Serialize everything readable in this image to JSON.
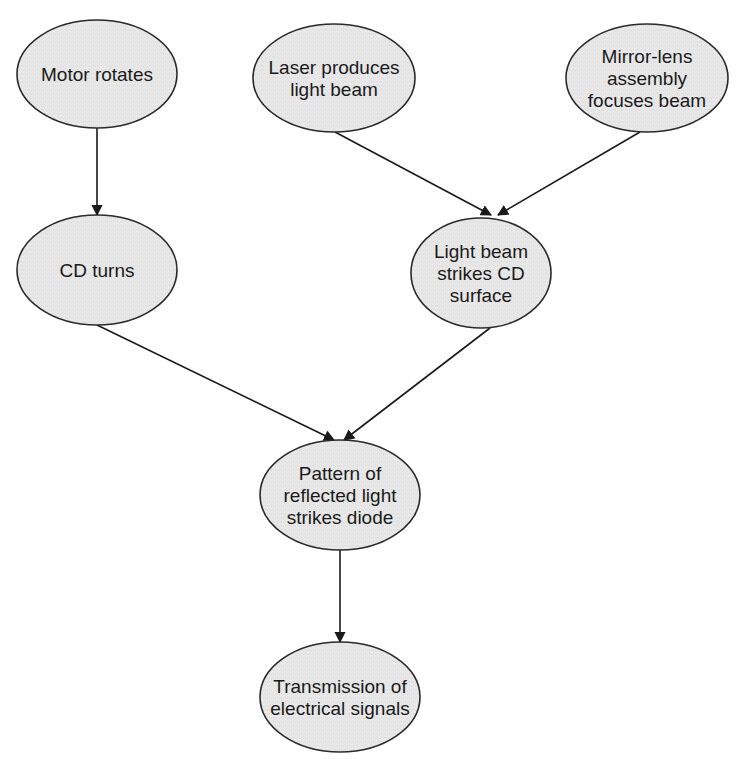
{
  "diagram": {
    "type": "flowchart",
    "colors": {
      "node_fill": "#e6e6e6",
      "node_stroke": "#2a2a2a",
      "edge": "#1a1a1a",
      "text": "#1a1a1a",
      "background": "#ffffff"
    },
    "nodes": [
      {
        "id": "motor",
        "lines": [
          "Motor rotates"
        ],
        "cx": 97,
        "cy": 74,
        "rx": 80,
        "ry": 54
      },
      {
        "id": "laser",
        "lines": [
          "Laser produces",
          "light beam"
        ],
        "cx": 334,
        "cy": 78,
        "rx": 81,
        "ry": 54
      },
      {
        "id": "mirror",
        "lines": [
          "Mirror-lens",
          "assembly",
          "focuses beam"
        ],
        "cx": 647,
        "cy": 78,
        "rx": 81,
        "ry": 54
      },
      {
        "id": "cdturns",
        "lines": [
          "CD turns"
        ],
        "cx": 97,
        "cy": 270,
        "rx": 80,
        "ry": 55
      },
      {
        "id": "strikes",
        "lines": [
          "Light beam",
          "strikes CD",
          "surface"
        ],
        "cx": 481,
        "cy": 273,
        "rx": 70,
        "ry": 55
      },
      {
        "id": "pattern",
        "lines": [
          "Pattern of",
          "reflected light",
          "strikes diode"
        ],
        "cx": 340,
        "cy": 495,
        "rx": 80,
        "ry": 55
      },
      {
        "id": "transmission",
        "lines": [
          "Transmission of",
          "electrical signals"
        ],
        "cx": 340,
        "cy": 697,
        "rx": 80,
        "ry": 55
      }
    ],
    "edges": [
      {
        "from": "motor",
        "to": "cdturns",
        "x1": 97,
        "y1": 128,
        "x2": 97,
        "y2": 215
      },
      {
        "from": "laser",
        "to": "strikes",
        "x1": 335,
        "y1": 132,
        "x2": 491,
        "y2": 215
      },
      {
        "from": "mirror",
        "to": "strikes",
        "x1": 640,
        "y1": 132,
        "x2": 498,
        "y2": 215
      },
      {
        "from": "cdturns",
        "to": "pattern",
        "x1": 97,
        "y1": 325,
        "x2": 334,
        "y2": 440
      },
      {
        "from": "strikes",
        "to": "pattern",
        "x1": 490,
        "y1": 328,
        "x2": 344,
        "y2": 440
      },
      {
        "from": "pattern",
        "to": "transmission",
        "x1": 340,
        "y1": 550,
        "x2": 340,
        "y2": 642
      }
    ]
  }
}
